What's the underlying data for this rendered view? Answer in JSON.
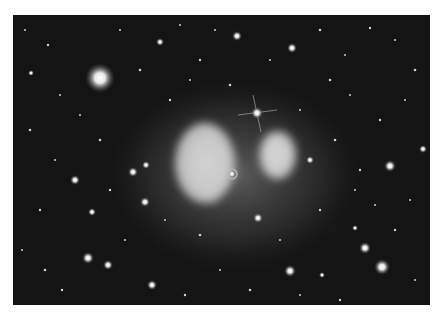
{
  "image": {
    "description": "Grayscale deep-field astronomical photograph of a galaxy cluster with two bright diffuse glowing lobes near center, a bright star with diffraction spikes above, and many scattered stars and galaxies",
    "background_color": "#ffffff",
    "sky_color": "#141414",
    "glow_color": "#d8d8d8",
    "frame": {
      "x": 13,
      "y": 15,
      "width": 417,
      "height": 290
    }
  },
  "features": {
    "left_lobe": {
      "cx": 205,
      "cy": 163
    },
    "right_lobe": {
      "cx": 280,
      "cy": 157
    },
    "spiked_star": {
      "cx": 257,
      "cy": 113
    },
    "big_star_top_left": {
      "cx": 100,
      "cy": 78
    },
    "ring_object": {
      "cx": 232,
      "cy": 174
    }
  }
}
